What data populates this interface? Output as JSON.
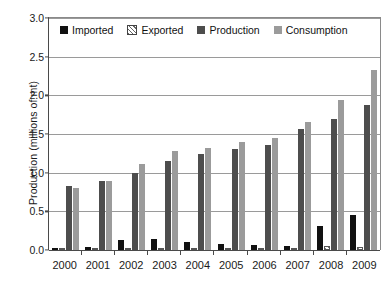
{
  "chart_data": {
    "type": "bar",
    "title": "",
    "xlabel": "",
    "ylabel": "Production (millions of mt)",
    "ylim": [
      0,
      3.0
    ],
    "ytick_values": [
      0.0,
      0.5,
      1.0,
      1.5,
      2.0,
      2.5,
      3.0
    ],
    "ytick_labels": [
      "0.0",
      "0.5",
      "1.0",
      "1.5",
      "2.0",
      "2.5",
      "3.0"
    ],
    "grid": true,
    "legend_position": "top-inside",
    "categories": [
      "2000",
      "2001",
      "2002",
      "2003",
      "2004",
      "2005",
      "2006",
      "2007",
      "2008",
      "2009"
    ],
    "series": [
      {
        "name": "Imported",
        "color": "#111111",
        "values": [
          0.02,
          0.04,
          0.13,
          0.14,
          0.11,
          0.08,
          0.06,
          0.05,
          0.31,
          0.45
        ]
      },
      {
        "name": "Exported",
        "color": "#ffffff",
        "values": [
          0.01,
          0.02,
          0.02,
          0.01,
          0.01,
          0.01,
          0.01,
          0.01,
          0.05,
          0.04
        ]
      },
      {
        "name": "Production",
        "color": "#4d4d4d",
        "values": [
          0.83,
          0.89,
          0.99,
          1.15,
          1.24,
          1.31,
          1.36,
          1.56,
          1.69,
          1.87
        ]
      },
      {
        "name": "Consumption",
        "color": "#9b9b9b",
        "values": [
          0.8,
          0.89,
          1.11,
          1.28,
          1.32,
          1.4,
          1.45,
          1.65,
          1.94,
          2.33
        ]
      }
    ]
  },
  "legend": {
    "items": [
      {
        "label": "Imported"
      },
      {
        "label": "Exported"
      },
      {
        "label": "Production"
      },
      {
        "label": "Consumption"
      }
    ]
  }
}
